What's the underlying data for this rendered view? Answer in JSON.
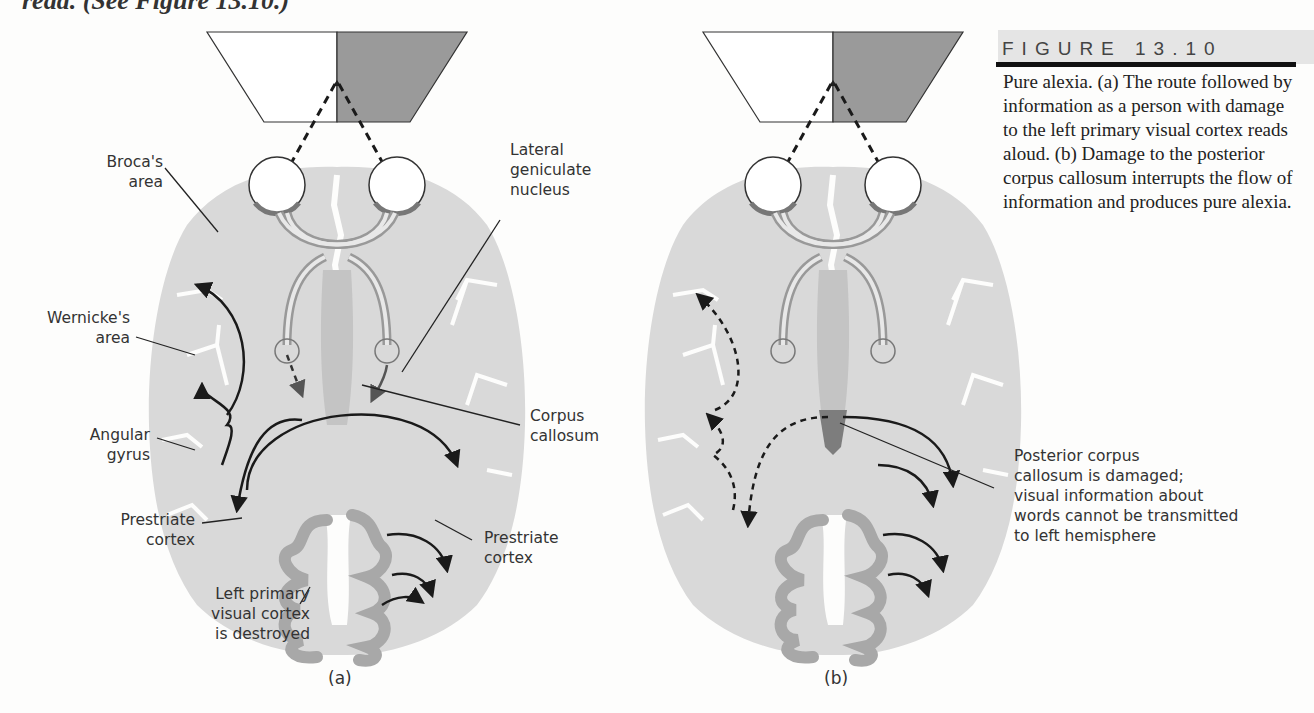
{
  "page": {
    "top_cutoff_text": "read. (See Figure 13.10.)"
  },
  "figure": {
    "number_label": "FIGURE 13.10",
    "caption": "Pure alexia. (a) The route followed by information as a person with damage to the left primary visual cortex reads aloud. (b) Damage to the posterior corpus callosum interrupts the flow of information and produces pure alexia."
  },
  "panel_a": {
    "tag": "(a)",
    "labels": {
      "brocas_area": [
        "Broca's",
        "area"
      ],
      "wernickes_area": [
        "Wernicke's",
        "area"
      ],
      "angular_gyrus": [
        "Angular",
        "gyrus"
      ],
      "prestriate_left": [
        "Prestriate",
        "cortex"
      ],
      "left_primary_visual": [
        "Left primary",
        "visual cortex",
        "is destroyed"
      ],
      "lateral_geniculate": [
        "Lateral",
        "geniculate",
        "nucleus"
      ],
      "corpus_callosum": [
        "Corpus",
        "callosum"
      ],
      "prestriate_right": [
        "Prestriate",
        "cortex"
      ]
    }
  },
  "panel_b": {
    "tag": "(b)",
    "labels": {
      "posterior_damage": [
        "Posterior corpus",
        "callosum is damaged;",
        "visual information about",
        "words cannot be transmitted",
        "to left hemisphere"
      ]
    }
  },
  "colors": {
    "brain_fill": "#d9d9d9",
    "cortex_band": "#a8a8a8",
    "visual_field_shaded": "#9a9a9a",
    "callosum": "#c4c4c4",
    "damage": "#7d7d7d",
    "ink": "#1a1a1a"
  }
}
